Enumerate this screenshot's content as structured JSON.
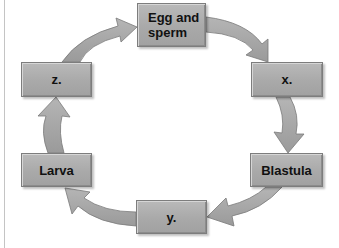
{
  "diagram": {
    "type": "life-cycle",
    "stages": [
      {
        "id": "egg",
        "label": "Egg and sperm"
      },
      {
        "id": "x",
        "label": "x."
      },
      {
        "id": "blastula",
        "label": "Blastula"
      },
      {
        "id": "y",
        "label": "y."
      },
      {
        "id": "larva",
        "label": "Larva"
      },
      {
        "id": "z",
        "label": "z."
      }
    ],
    "flow": [
      "Egg and sperm",
      "x.",
      "Blastula",
      "y.",
      "Larva",
      "z.",
      "Egg and sperm"
    ],
    "colors": {
      "box_fill": "#ababab",
      "arrow_fill": "#a6a6a6",
      "text": "#111111"
    }
  }
}
